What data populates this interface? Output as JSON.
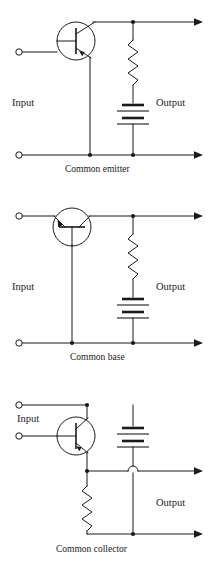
{
  "figure": {
    "stroke_color": "#1a1a1a",
    "background_color": "#ffffff"
  },
  "circuits": [
    {
      "id": "common-emitter",
      "caption": "Common emitter",
      "input_label": "Input",
      "output_label": "Output",
      "transistor": {
        "type": "pnp",
        "orientation": "vertical",
        "base_terminal": "left",
        "collector_terminal": "top",
        "emitter_terminal": "bottom",
        "arrow_on": "emitter",
        "arrow_direction": "inward"
      },
      "components": [
        {
          "kind": "resistor",
          "orientation": "vertical"
        },
        {
          "kind": "battery",
          "orientation": "vertical",
          "cells": 2
        }
      ],
      "terminals": {
        "input_count": 2,
        "output_count": 2
      }
    },
    {
      "id": "common-base",
      "caption": "Common base",
      "input_label": "Input",
      "output_label": "Output",
      "transistor": {
        "type": "pnp",
        "orientation": "horizontal",
        "base_terminal": "bottom",
        "collector_terminal": "right",
        "emitter_terminal": "left",
        "arrow_on": "emitter",
        "arrow_direction": "inward"
      },
      "components": [
        {
          "kind": "resistor",
          "orientation": "vertical"
        },
        {
          "kind": "battery",
          "orientation": "vertical",
          "cells": 2
        }
      ],
      "terminals": {
        "input_count": 2,
        "output_count": 2
      }
    },
    {
      "id": "common-collector",
      "caption": "Common collector",
      "input_label": "Input",
      "output_label": "Output",
      "transistor": {
        "type": "pnp",
        "orientation": "vertical",
        "base_terminal": "left",
        "collector_terminal": "top",
        "emitter_terminal": "bottom",
        "arrow_on": "emitter",
        "arrow_direction": "inward"
      },
      "components": [
        {
          "kind": "battery",
          "orientation": "vertical",
          "cells": 2
        },
        {
          "kind": "resistor",
          "orientation": "vertical"
        },
        {
          "kind": "wire-hop",
          "orientation": "horizontal"
        }
      ],
      "terminals": {
        "input_count": 2,
        "output_count": 2
      }
    }
  ]
}
